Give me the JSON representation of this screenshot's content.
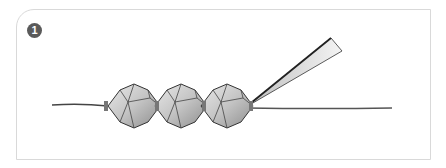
{
  "step": {
    "number": "1"
  },
  "illustration": {
    "description": "Three bicone beads strung on a wire, with a needle-nose tool pointing at the rightmost bead",
    "bead_count": 3,
    "colors": {
      "frame_border": "#d9d9d9",
      "badge": "#5a5a5a",
      "bead_fill": "#c8c8c8",
      "outline": "#333333"
    }
  }
}
